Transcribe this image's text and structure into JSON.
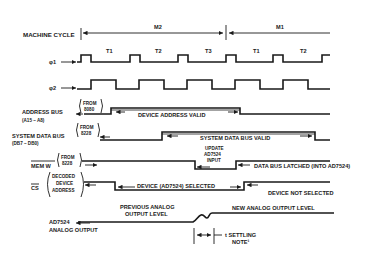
{
  "diagram": {
    "machine_cycle": {
      "label": "MACHINE CYCLE",
      "cycles": [
        "M2",
        "M1"
      ]
    },
    "clocks": {
      "phi1_label": "φ1",
      "phi2_label": "φ2",
      "states": [
        "T1",
        "T2",
        "T3",
        "T1",
        "T2"
      ]
    },
    "signals": {
      "address_bus": {
        "label": "ADDRESS BUS",
        "sublabel": "(A15 – A8)",
        "source_line1": "FROM",
        "source_line2": "8080",
        "annotation": "DEVICE ADDRESS VALID"
      },
      "system_data_bus": {
        "label": "SYSTEM DATA BUS",
        "sublabel": "(DB7 – DB0)",
        "source_line1": "FROM",
        "source_line2": "8228",
        "annotation": "SYSTEM DATA BUS VALID"
      },
      "mem_w": {
        "label": "MEM W",
        "source_line1": "FROM",
        "source_line2": "8228",
        "pulse_line1": "UPDATE",
        "pulse_line2": "AD7524",
        "pulse_line3": "INPUT",
        "annotation": "DATA BUS LATCHED (INTO AD7524)"
      },
      "cs": {
        "label": "CS",
        "source_line1": "DECODED",
        "source_line2": "DEVICE",
        "source_line3": "ADDRESS",
        "annotation_selected": "DEVICE (AD7524) SELECTED",
        "annotation_not_selected": "DEVICE NOT SELECTED"
      },
      "analog_output": {
        "label_line1": "AD7524",
        "label_line2": "ANALOG OUTPUT",
        "previous_line1": "PREVIOUS ANALOG",
        "previous_line2": "OUTPUT LEVEL",
        "new_level": "NEW ANALOG OUTPUT LEVEL",
        "settling_line1": "t SETTLING",
        "settling_line2": "NOTE¹"
      }
    }
  }
}
